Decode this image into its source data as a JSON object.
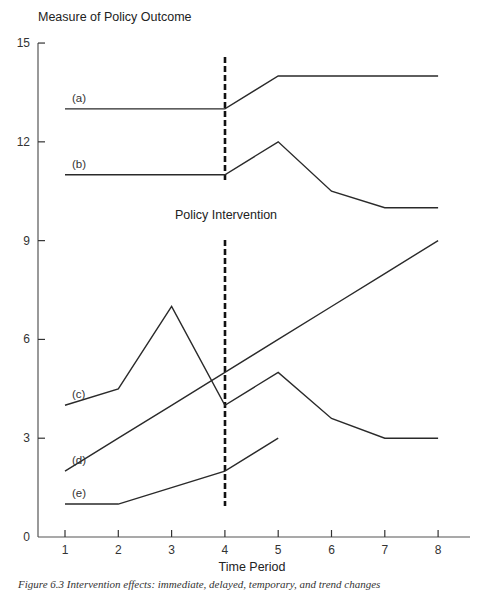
{
  "chart_data": {
    "type": "line",
    "title": "",
    "xlabel": "Time Period",
    "ylabel": "Measure of Policy Outcome",
    "x": [
      1,
      2,
      3,
      4,
      5,
      6,
      7,
      8
    ],
    "xticks": [
      "1",
      "2",
      "3",
      "4",
      "5",
      "6",
      "7",
      "8"
    ],
    "yticks": [
      "0",
      "3",
      "6",
      "9",
      "12",
      "15"
    ],
    "ylim": [
      0,
      15
    ],
    "xlim": [
      0.5,
      8.6
    ],
    "grid": false,
    "legend": "inline labels at start of each series",
    "series": [
      {
        "name": "(a)",
        "x": [
          1,
          2,
          3,
          4,
          5,
          6,
          7,
          8
        ],
        "values": [
          13,
          13,
          13,
          13,
          14,
          14,
          14,
          14
        ]
      },
      {
        "name": "(b)",
        "x": [
          1,
          2,
          3,
          4,
          5,
          6,
          7,
          8
        ],
        "values": [
          11,
          11,
          11,
          11,
          12,
          10.5,
          10,
          10
        ]
      },
      {
        "name": "(c)",
        "x": [
          1,
          2,
          3,
          4,
          5,
          6,
          7,
          8
        ],
        "values": [
          4,
          4.5,
          7,
          4,
          5,
          3.6,
          3,
          3
        ]
      },
      {
        "name": "(d)",
        "x": [
          1,
          2,
          3,
          4,
          5,
          6,
          7,
          8
        ],
        "values": [
          2,
          3,
          4,
          5,
          6,
          7,
          8,
          9
        ]
      },
      {
        "name": "(e)",
        "x": [
          1,
          2,
          3,
          4,
          5
        ],
        "values": [
          1,
          1,
          1.5,
          2,
          3
        ]
      }
    ],
    "annotations": [
      {
        "text": "Policy Intervention",
        "x": 4,
        "type": "vertical dashed line"
      }
    ]
  },
  "labels": {
    "y_axis_title": "Measure of Policy Outcome",
    "x_axis_title": "Time Period",
    "intervention": "Policy Intervention",
    "caption": "Figure 6.3   Intervention effects: immediate, delayed, temporary, and trend changes"
  }
}
